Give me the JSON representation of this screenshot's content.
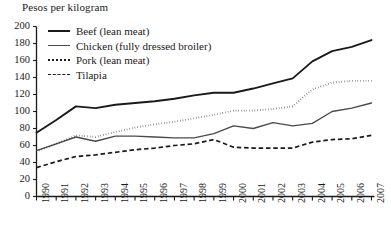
{
  "chart_data": {
    "type": "line",
    "title": "Pesos per kilogram",
    "xlabel": "",
    "ylabel": "Pesos per kilogram",
    "ylim": [
      0,
      200
    ],
    "ytick_step": 20,
    "yticks": [
      0,
      20,
      40,
      60,
      80,
      100,
      120,
      140,
      160,
      180,
      200
    ],
    "grid": false,
    "legend_position": "top-left",
    "x": [
      1990,
      1991,
      1992,
      1993,
      1994,
      1995,
      1996,
      1997,
      1998,
      1999,
      2000,
      2001,
      2002,
      2003,
      2004,
      2005,
      2006,
      2007
    ],
    "categories": [
      "1990",
      "1991",
      "1992",
      "1993",
      "1994",
      "1995",
      "1996",
      "1997",
      "1998",
      "1999",
      "2000",
      "2001",
      "2002",
      "2003",
      "2004",
      "2005",
      "2006",
      "2007"
    ],
    "series": [
      {
        "name": "Beef (lean meat)",
        "style": "solid-thick",
        "color": "#1a1a1a",
        "values": [
          75,
          90,
          106,
          104,
          108,
          110,
          112,
          115,
          119,
          122,
          122,
          127,
          133,
          139,
          159,
          171,
          176,
          184
        ]
      },
      {
        "name": "Chicken (fully dressed broiler)",
        "style": "solid-thin",
        "color": "#4a4a4a",
        "values": [
          54,
          62,
          70,
          65,
          71,
          71,
          70,
          69,
          69,
          74,
          83,
          80,
          87,
          83,
          86,
          100,
          104,
          110
        ]
      },
      {
        "name": "Pork (lean meat)",
        "style": "dotted",
        "color": "#1a1a1a",
        "values": [
          53,
          62,
          72,
          70,
          76,
          81,
          85,
          88,
          92,
          96,
          101,
          101,
          103,
          106,
          126,
          134,
          136,
          136
        ]
      },
      {
        "name": "Tilapia",
        "style": "dashed",
        "color": "#1a1a1a",
        "values": [
          34,
          41,
          47,
          49,
          52,
          55,
          57,
          60,
          62,
          67,
          58,
          57,
          57,
          57,
          64,
          67,
          68,
          72
        ]
      }
    ]
  }
}
